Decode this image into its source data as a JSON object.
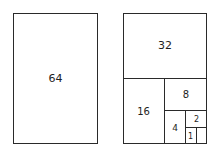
{
  "diagram": {
    "left": {
      "label": "64"
    },
    "right": {
      "cells": [
        {
          "label": "32"
        },
        {
          "label": "16"
        },
        {
          "label": "8"
        },
        {
          "label": "4"
        },
        {
          "label": "2"
        },
        {
          "label": "1"
        }
      ]
    }
  }
}
